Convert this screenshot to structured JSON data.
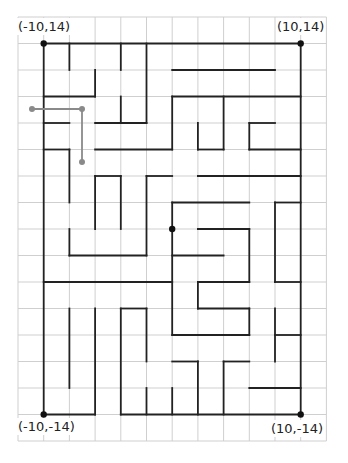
{
  "diagram": {
    "type": "maze-on-grid",
    "grid": {
      "origin_px": [
        18,
        17
      ],
      "cell_w": 25.7,
      "cell_h": 26.5,
      "cols": 12,
      "rows": 16,
      "line_color": "#cfcfcf"
    },
    "maze": {
      "offset_cells": [
        1,
        1
      ],
      "line_color": "#222222",
      "line_width": 1.8,
      "walls": [
        [
          0,
          0,
          10,
          0
        ],
        [
          0,
          0,
          0,
          14
        ],
        [
          10,
          0,
          10,
          14
        ],
        [
          0,
          14,
          2,
          14
        ],
        [
          3,
          14,
          10,
          14
        ],
        [
          1,
          0,
          1,
          1
        ],
        [
          3,
          0,
          3,
          1
        ],
        [
          4,
          0,
          4,
          3
        ],
        [
          2,
          1,
          2,
          2
        ],
        [
          0,
          2,
          2,
          2
        ],
        [
          3,
          2,
          3,
          3
        ],
        [
          2,
          3,
          4,
          3
        ],
        [
          0,
          3,
          1,
          3
        ],
        [
          0,
          4,
          1,
          4
        ],
        [
          1,
          4,
          1,
          6
        ],
        [
          2,
          4,
          5,
          4
        ],
        [
          5,
          2,
          5,
          4
        ],
        [
          5,
          2,
          10,
          2
        ],
        [
          5,
          1,
          9,
          1
        ],
        [
          6,
          3,
          6,
          4
        ],
        [
          6,
          4,
          7,
          4
        ],
        [
          7,
          2,
          7,
          4
        ],
        [
          8,
          3,
          9,
          3
        ],
        [
          8,
          3,
          8,
          4
        ],
        [
          8,
          4,
          10,
          4
        ],
        [
          2,
          5,
          3,
          5
        ],
        [
          2,
          5,
          2,
          7
        ],
        [
          3,
          5,
          3,
          7
        ],
        [
          4,
          5,
          5,
          5
        ],
        [
          4,
          5,
          4,
          8
        ],
        [
          6,
          5,
          10,
          5
        ],
        [
          1,
          7,
          1,
          8
        ],
        [
          1,
          8,
          4,
          8
        ],
        [
          5,
          6,
          8,
          6
        ],
        [
          5,
          6,
          5,
          11
        ],
        [
          9,
          6,
          10,
          6
        ],
        [
          9,
          6,
          9,
          9
        ],
        [
          9,
          9,
          10,
          9
        ],
        [
          6,
          7,
          8,
          7
        ],
        [
          8,
          7,
          8,
          9
        ],
        [
          5,
          8,
          7,
          8
        ],
        [
          0,
          9,
          5,
          9
        ],
        [
          6,
          9,
          8,
          9
        ],
        [
          6,
          9,
          6,
          10
        ],
        [
          6,
          10,
          8,
          10
        ],
        [
          8,
          10,
          8,
          11
        ],
        [
          5,
          11,
          8,
          11
        ],
        [
          1,
          10,
          1,
          13
        ],
        [
          2,
          10,
          2,
          14
        ],
        [
          3,
          10,
          3,
          14
        ],
        [
          3,
          10,
          4,
          10
        ],
        [
          4,
          10,
          4,
          12
        ],
        [
          4,
          13,
          4,
          14
        ],
        [
          9,
          10,
          9,
          12
        ],
        [
          9,
          11,
          10,
          11
        ],
        [
          5,
          12,
          6,
          12
        ],
        [
          6,
          12,
          6,
          14
        ],
        [
          7,
          12,
          8,
          12
        ],
        [
          7,
          12,
          7,
          14
        ],
        [
          5,
          13,
          5,
          14
        ],
        [
          8,
          13,
          10,
          13
        ]
      ],
      "dots": [
        [
          0,
          0
        ],
        [
          10,
          0
        ],
        [
          0,
          14
        ],
        [
          10,
          14
        ],
        [
          5,
          7
        ]
      ]
    },
    "path": {
      "color": "#8a8a8a",
      "points_px": [
        [
          32,
          109
        ],
        [
          82,
          109
        ],
        [
          82,
          162
        ]
      ],
      "dots_px": [
        [
          32,
          109
        ],
        [
          82,
          109
        ],
        [
          82,
          162
        ]
      ]
    },
    "labels": [
      {
        "id": "top-left",
        "text": "(-10,14)",
        "x": 17,
        "y": 18
      },
      {
        "id": "top-right",
        "text": "(10,14)",
        "x": 276,
        "y": 18
      },
      {
        "id": "bottom-left",
        "text": "(-10,-14)",
        "x": 17,
        "y": 418
      },
      {
        "id": "bottom-right",
        "text": "(10,-14)",
        "x": 270,
        "y": 420
      }
    ]
  }
}
